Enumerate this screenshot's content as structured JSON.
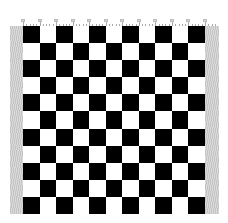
{
  "board": {
    "rows": 11,
    "columns": 11,
    "first_square": "black",
    "colors": {
      "dark": "#000000",
      "light": "#ffffff"
    }
  },
  "ruler": {
    "major_ticks": 12,
    "minor_per_major": 4,
    "color": "#9a9a9a"
  },
  "margins": {
    "color": "#cfcfcf"
  }
}
